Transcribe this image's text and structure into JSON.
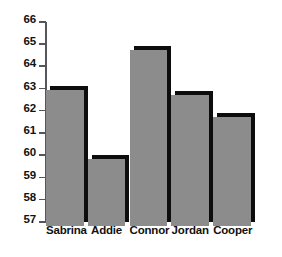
{
  "chart_data": {
    "type": "bar",
    "title": "",
    "xlabel": "",
    "ylabel": "",
    "categories": [
      "Sabrina",
      "Addie",
      "Connor",
      "Jordan",
      "Cooper"
    ],
    "values": [
      63.1,
      60.0,
      64.9,
      62.9,
      61.9
    ],
    "ylim": [
      57,
      66
    ],
    "yticks": [
      57,
      58,
      59,
      60,
      61,
      62,
      63,
      64,
      65,
      66
    ],
    "ytick_labels": [
      "57",
      "58",
      "59",
      "60",
      "61",
      "62",
      "63",
      "64",
      "65",
      "66"
    ],
    "grid": false,
    "legend": null,
    "legend_position": "none",
    "bar_color": "#8c8c8c",
    "bar_shadow_color": "#0d0d0d",
    "axis_color": "#55565a",
    "background_color": "#ffffff"
  }
}
